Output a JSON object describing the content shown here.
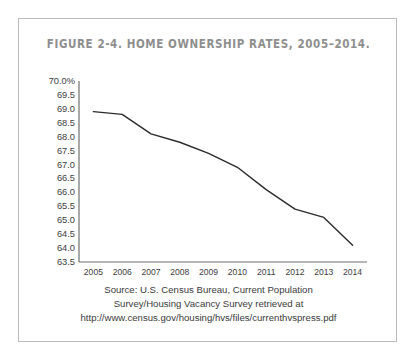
{
  "figure": {
    "title": "FIGURE 2-4. HOME OWNERSHIP RATES, 2005–2014.",
    "source_lines": [
      "Source: U.S. Census Bureau, Current Population",
      "Survey/Housing Vacancy Survey retrieved at",
      "http://www.census.gov/housing/hvs/files/currenthvspress.pdf"
    ]
  },
  "chart_data": {
    "type": "line",
    "title": "FIGURE 2-4. HOME OWNERSHIP RATES, 2005–2014.",
    "xlabel": "",
    "ylabel": "",
    "categories": [
      "2005",
      "2006",
      "2007",
      "2008",
      "2009",
      "2010",
      "2011",
      "2012",
      "2013",
      "2014"
    ],
    "x": [
      2005,
      2006,
      2007,
      2008,
      2009,
      2010,
      2011,
      2012,
      2013,
      2014
    ],
    "values": [
      68.9,
      68.8,
      68.1,
      67.8,
      67.4,
      66.9,
      66.1,
      65.4,
      65.1,
      64.1
    ],
    "series": [
      {
        "name": "Home ownership rate",
        "values": [
          68.9,
          68.8,
          68.1,
          67.8,
          67.4,
          66.9,
          66.1,
          65.4,
          65.1,
          64.1
        ]
      }
    ],
    "ylim": [
      63.5,
      70.0
    ],
    "xlim": [
      2005,
      2014
    ],
    "ytick_labels": [
      "70.0%",
      "69.5",
      "69.0",
      "68.5",
      "68.0",
      "67.5",
      "67.0",
      "66.5",
      "66.0",
      "65.5",
      "65.0",
      "64.5",
      "64.0",
      "63.5"
    ],
    "ytick_values": [
      70.0,
      69.5,
      69.0,
      68.5,
      68.0,
      67.5,
      67.0,
      66.5,
      66.0,
      65.5,
      65.0,
      64.5,
      64.0,
      63.5
    ],
    "xtick_labels": [
      "2005",
      "2006",
      "2007",
      "2008",
      "2009",
      "2010",
      "2011",
      "2012",
      "2013",
      "2014"
    ],
    "grid": false,
    "legend": false,
    "line_color": "#2b2b2b",
    "axis_color": "#6f6f6f",
    "unit": "percent"
  }
}
